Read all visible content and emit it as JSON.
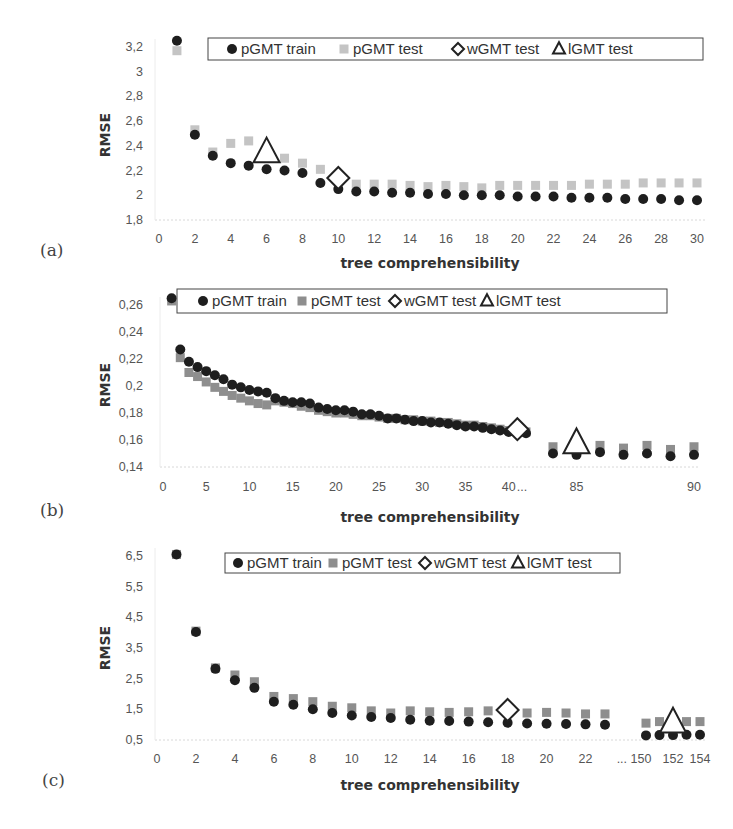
{
  "panels": [
    {
      "label": "(a)",
      "legend": [
        "pGMT train",
        "pGMT test",
        "wGMT test",
        "lGMT test"
      ]
    },
    {
      "label": "(b)",
      "legend": [
        "pGMT train",
        "pGMT test",
        "wGMT test",
        "lGMT test"
      ]
    },
    {
      "label": "(c)",
      "legend": [
        "pGMT train",
        "pGMT test",
        "wGMT test",
        "lGMT test"
      ]
    }
  ],
  "colors": {
    "train": "#1e1e1e",
    "test_a": "#c4c4c4",
    "test_bc": "#8e8e8e",
    "marker_outline": "#222222"
  },
  "chart_data": [
    {
      "type": "scatter",
      "panel": "(a)",
      "title": "",
      "xlabel": "tree comprehensibility",
      "ylabel": "RMSE",
      "x_ticks": [
        "0",
        "2",
        "4",
        "6",
        "8",
        "10",
        "12",
        "14",
        "16",
        "18",
        "20",
        "22",
        "24",
        "26",
        "28",
        "30"
      ],
      "y_ticks": [
        "1,8",
        "2",
        "2,2",
        "2,4",
        "2,6",
        "2,8",
        "3",
        "3,2"
      ],
      "ylim": [
        1.8,
        3.2
      ],
      "xlim": [
        0,
        30
      ],
      "legend_position": "top",
      "grid": false,
      "series": [
        {
          "name": "pGMT train",
          "marker": "circle",
          "x": [
            1,
            2,
            3,
            4,
            5,
            6,
            7,
            8,
            9,
            10,
            11,
            12,
            13,
            14,
            15,
            16,
            17,
            18,
            19,
            20,
            21,
            22,
            23,
            24,
            25,
            26,
            27,
            28,
            29,
            30
          ],
          "values": [
            3.25,
            2.49,
            2.32,
            2.26,
            2.24,
            2.21,
            2.2,
            2.18,
            2.1,
            2.05,
            2.03,
            2.03,
            2.02,
            2.02,
            2.01,
            2.01,
            2.0,
            2.0,
            2.0,
            1.99,
            1.99,
            1.99,
            1.98,
            1.98,
            1.98,
            1.97,
            1.97,
            1.97,
            1.96,
            1.96
          ]
        },
        {
          "name": "pGMT test",
          "marker": "square",
          "x": [
            1,
            2,
            3,
            4,
            5,
            6,
            7,
            8,
            9,
            10,
            11,
            12,
            13,
            14,
            15,
            16,
            17,
            18,
            19,
            20,
            21,
            22,
            23,
            24,
            25,
            26,
            27,
            28,
            29,
            30
          ],
          "values": [
            3.17,
            2.53,
            2.35,
            2.42,
            2.44,
            2.33,
            2.3,
            2.26,
            2.21,
            2.13,
            2.09,
            2.09,
            2.09,
            2.08,
            2.07,
            2.08,
            2.07,
            2.06,
            2.08,
            2.08,
            2.08,
            2.08,
            2.08,
            2.09,
            2.09,
            2.09,
            2.1,
            2.1,
            2.1,
            2.1
          ]
        },
        {
          "name": "wGMT test",
          "marker": "diamond",
          "x": [
            10
          ],
          "values": [
            2.14
          ]
        },
        {
          "name": "lGMT test",
          "marker": "triangle",
          "x": [
            6
          ],
          "values": [
            2.33
          ]
        }
      ]
    },
    {
      "type": "scatter",
      "panel": "(b)",
      "title": "",
      "xlabel": "tree comprehensibility",
      "ylabel": "RMSE",
      "x_ticks": [
        "0",
        "5",
        "10",
        "15",
        "20",
        "25",
        "30",
        "35",
        "40",
        "...",
        "85",
        "90"
      ],
      "y_ticks": [
        "0,14",
        "0,16",
        "0,18",
        "0,2",
        "0,22",
        "0,24",
        "0,26"
      ],
      "ylim": [
        0.14,
        0.26
      ],
      "xlim": [
        0,
        90
      ],
      "axis_break": "between 42 and 84",
      "legend_position": "top",
      "grid": false,
      "series": [
        {
          "name": "pGMT train",
          "marker": "circle",
          "x": [
            1,
            2,
            3,
            4,
            5,
            6,
            7,
            8,
            9,
            10,
            11,
            12,
            13,
            14,
            15,
            16,
            17,
            18,
            19,
            20,
            21,
            22,
            23,
            24,
            25,
            26,
            27,
            28,
            29,
            30,
            31,
            32,
            33,
            34,
            35,
            36,
            37,
            38,
            39,
            40,
            41,
            42,
            84,
            85,
            86,
            87,
            88,
            89,
            90
          ],
          "values": [
            0.265,
            0.227,
            0.218,
            0.214,
            0.211,
            0.208,
            0.205,
            0.201,
            0.199,
            0.197,
            0.196,
            0.195,
            0.191,
            0.189,
            0.188,
            0.188,
            0.187,
            0.184,
            0.183,
            0.182,
            0.182,
            0.181,
            0.179,
            0.179,
            0.178,
            0.176,
            0.176,
            0.175,
            0.174,
            0.174,
            0.173,
            0.173,
            0.172,
            0.171,
            0.17,
            0.17,
            0.169,
            0.168,
            0.167,
            0.166,
            0.166,
            0.165,
            0.15,
            0.149,
            0.151,
            0.149,
            0.15,
            0.148,
            0.149
          ]
        },
        {
          "name": "pGMT test",
          "marker": "square",
          "x": [
            1,
            2,
            3,
            4,
            5,
            6,
            7,
            8,
            9,
            10,
            11,
            12,
            13,
            14,
            15,
            16,
            17,
            18,
            19,
            20,
            21,
            22,
            23,
            24,
            25,
            26,
            27,
            28,
            29,
            30,
            31,
            32,
            33,
            34,
            35,
            36,
            37,
            38,
            39,
            40,
            41,
            42,
            84,
            85,
            86,
            87,
            88,
            89,
            90
          ],
          "values": [
            0.263,
            0.221,
            0.21,
            0.207,
            0.203,
            0.199,
            0.196,
            0.193,
            0.191,
            0.189,
            0.187,
            0.186,
            0.189,
            0.188,
            0.187,
            0.185,
            0.184,
            0.182,
            0.181,
            0.18,
            0.18,
            0.179,
            0.178,
            0.178,
            0.177,
            0.176,
            0.176,
            0.175,
            0.175,
            0.174,
            0.174,
            0.173,
            0.173,
            0.172,
            0.171,
            0.171,
            0.17,
            0.169,
            0.168,
            0.167,
            0.166,
            0.166,
            0.155,
            0.154,
            0.156,
            0.154,
            0.156,
            0.153,
            0.155
          ]
        },
        {
          "name": "wGMT test",
          "marker": "diamond",
          "x": [
            41
          ],
          "values": [
            0.168
          ]
        },
        {
          "name": "lGMT test",
          "marker": "triangle",
          "x": [
            85
          ],
          "values": [
            0.156
          ]
        }
      ]
    },
    {
      "type": "scatter",
      "panel": "(c)",
      "title": "",
      "xlabel": "tree comprehensibility",
      "ylabel": "RMSE",
      "x_ticks": [
        "0",
        "2",
        "4",
        "6",
        "8",
        "10",
        "12",
        "14",
        "16",
        "18",
        "20",
        "22",
        "... 150",
        "152",
        "154"
      ],
      "y_ticks": [
        "0,5",
        "1,5",
        "2,5",
        "3,5",
        "4,5",
        "5,5",
        "6,5"
      ],
      "ylim": [
        0.5,
        6.5
      ],
      "xlim": [
        0,
        154
      ],
      "axis_break": "between 23 and 150",
      "legend_position": "top",
      "grid": false,
      "series": [
        {
          "name": "pGMT train",
          "marker": "circle",
          "x": [
            1,
            2,
            3,
            4,
            5,
            6,
            7,
            8,
            9,
            10,
            11,
            12,
            13,
            14,
            15,
            16,
            17,
            18,
            19,
            20,
            21,
            22,
            23,
            150,
            151,
            152,
            153,
            154
          ],
          "values": [
            6.55,
            4.02,
            2.82,
            2.45,
            2.2,
            1.75,
            1.65,
            1.5,
            1.38,
            1.3,
            1.25,
            1.22,
            1.16,
            1.13,
            1.12,
            1.1,
            1.08,
            1.06,
            1.04,
            1.03,
            1.02,
            1.01,
            1.0,
            0.65,
            0.66,
            0.66,
            0.67,
            0.67
          ]
        },
        {
          "name": "pGMT test",
          "marker": "square",
          "x": [
            1,
            2,
            3,
            4,
            5,
            6,
            7,
            8,
            9,
            10,
            11,
            12,
            13,
            14,
            15,
            16,
            17,
            18,
            19,
            20,
            21,
            22,
            23,
            150,
            151,
            152,
            153,
            154
          ],
          "values": [
            6.55,
            4.05,
            2.85,
            2.62,
            2.4,
            1.92,
            1.85,
            1.75,
            1.6,
            1.55,
            1.45,
            1.38,
            1.45,
            1.42,
            1.4,
            1.42,
            1.45,
            1.42,
            1.38,
            1.4,
            1.38,
            1.35,
            1.35,
            1.05,
            1.1,
            1.05,
            1.1,
            1.1
          ]
        },
        {
          "name": "wGMT test",
          "marker": "diamond",
          "x": [
            18
          ],
          "values": [
            1.48
          ]
        },
        {
          "name": "lGMT test",
          "marker": "triangle",
          "x": [
            152
          ],
          "values": [
            1.0
          ]
        }
      ]
    }
  ]
}
